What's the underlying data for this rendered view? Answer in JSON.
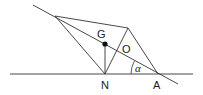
{
  "diagram": {
    "labels": {
      "G": "G",
      "O": "O",
      "N": "N",
      "A": "A",
      "alpha": "α"
    },
    "colors": {
      "stroke": "#333333",
      "dot": "#111111"
    }
  }
}
